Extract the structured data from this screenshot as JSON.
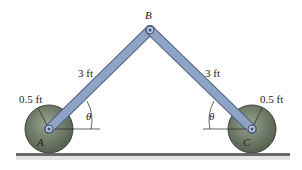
{
  "diagram": {
    "points": {
      "A": "A",
      "B": "B",
      "C": "C"
    },
    "labels": {
      "link_ab_length": "3 ft",
      "link_bc_length": "3 ft",
      "wheel_a_radius": "0.5 ft",
      "wheel_c_radius": "0.5 ft",
      "angle_a": "θ",
      "angle_c": "θ"
    },
    "colors": {
      "link": "#8fa3c4",
      "link_edge": "#4f6286",
      "wheel": "#6f7d66",
      "wheel_edge": "#3e463a",
      "ground": "#6b6b6b"
    }
  }
}
